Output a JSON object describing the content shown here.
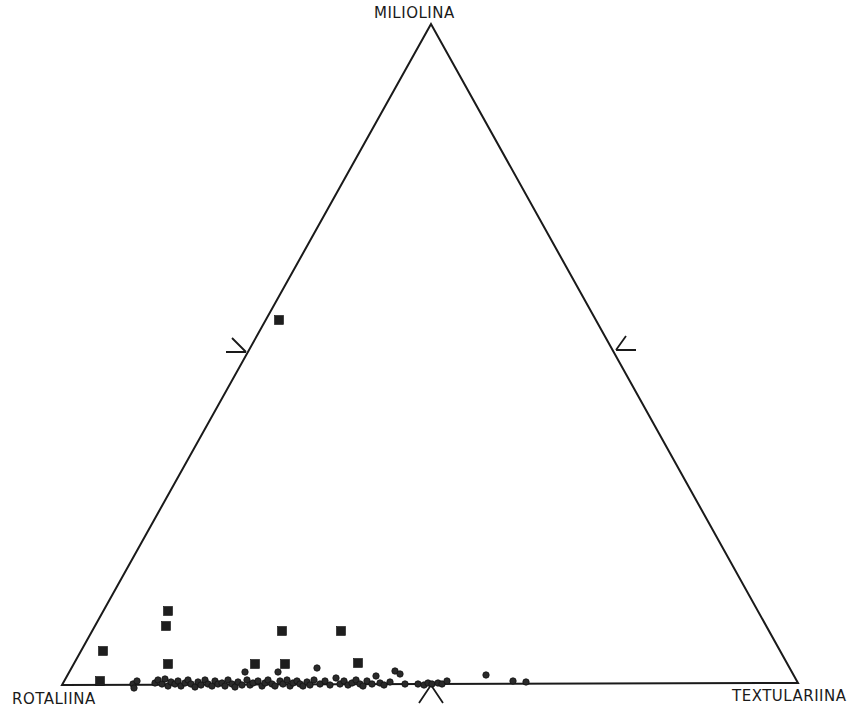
{
  "chart_data": {
    "type": "scatter",
    "subtype": "ternary",
    "title": "",
    "vertices": {
      "top": "MILIOLINA",
      "bottom_left": "ROTALIINA",
      "bottom_right": "TEXTULARIINA"
    },
    "components": [
      "Rotaliina",
      "Miliolina",
      "Textulariina"
    ],
    "units": "percent",
    "axis_marks": [
      {
        "edge": "left (Rotaliina–Miliolina)",
        "position_pct_miliolina": 50,
        "glyph": "arrow pointing toward edge"
      },
      {
        "edge": "right (Miliolina–Textulariina)",
        "position_pct_miliolina": 50,
        "glyph": "arrow pointing toward edge"
      },
      {
        "edge": "bottom (Rotaliina–Textulariina)",
        "position_pct_textulariina": 50,
        "glyph": "arrow pointing toward edge"
      }
    ],
    "grid": false,
    "legend": null,
    "series": [
      {
        "name": "squares",
        "marker": "filled-square",
        "points": [
          {
            "rotaliina": 46,
            "miliolina": 55,
            "textulariina": 0
          },
          {
            "rotaliina": 85,
            "miliolina": 11,
            "textulariina": 4
          },
          {
            "rotaliina": 84,
            "miliolina": 9,
            "textulariina": 7
          },
          {
            "rotaliina": 85,
            "miliolina": 3,
            "textulariina": 12
          },
          {
            "rotaliina": 92,
            "miliolina": 5,
            "textulariina": 3
          },
          {
            "rotaliina": 95,
            "miliolina": 0,
            "textulariina": 5
          },
          {
            "rotaliina": 68,
            "miliolina": 8,
            "textulariina": 24
          },
          {
            "rotaliina": 70,
            "miliolina": 3,
            "textulariina": 27
          },
          {
            "rotaliina": 67,
            "miliolina": 3,
            "textulariina": 30
          },
          {
            "rotaliina": 59,
            "miliolina": 8,
            "textulariina": 33
          },
          {
            "rotaliina": 57,
            "miliolina": 3,
            "textulariina": 40
          }
        ]
      },
      {
        "name": "circles",
        "marker": "filled-circle",
        "points_x_pct_textulariina_near_base": [
          10,
          11,
          13,
          14,
          15,
          16,
          17,
          18,
          19,
          20,
          21,
          22,
          23,
          24,
          25,
          26,
          27,
          28,
          29,
          30,
          31,
          32,
          33,
          34,
          35,
          36,
          37,
          38,
          39,
          40,
          41,
          42,
          43,
          44,
          45,
          46,
          47,
          48,
          49,
          50,
          51,
          52,
          58,
          61,
          62
        ],
        "points_above_base": [
          {
            "rotaliina": 74,
            "miliolina": 2,
            "textulariina": 24
          },
          {
            "rotaliina": 68,
            "miliolina": 2,
            "textulariina": 30
          },
          {
            "rotaliina": 62,
            "miliolina": 2,
            "textulariina": 36
          },
          {
            "rotaliina": 55,
            "miliolina": 2,
            "textulariina": 43
          },
          {
            "rotaliina": 40,
            "miliolina": 1,
            "textulariina": 59
          }
        ]
      }
    ]
  },
  "plot": {
    "width": 868,
    "height": 717,
    "triangle": {
      "top": [
        431,
        24
      ],
      "bottom_left": [
        62,
        685
      ],
      "bottom_right": [
        798,
        683
      ]
    },
    "line_color": "#1a1a1a",
    "marker_color": "#1a1a1a",
    "squares_px": [
      [
        279,
        320
      ],
      [
        168,
        611
      ],
      [
        166,
        626
      ],
      [
        282,
        631
      ],
      [
        341,
        631
      ],
      [
        103,
        651
      ],
      [
        168,
        664
      ],
      [
        255,
        664
      ],
      [
        285,
        664
      ],
      [
        358,
        663
      ],
      [
        100,
        681
      ]
    ],
    "circles_px": [
      [
        133,
        684
      ],
      [
        134,
        688
      ],
      [
        137,
        681
      ],
      [
        155,
        683
      ],
      [
        158,
        680
      ],
      [
        162,
        684
      ],
      [
        165,
        679
      ],
      [
        168,
        686
      ],
      [
        171,
        682
      ],
      [
        175,
        684
      ],
      [
        178,
        681
      ],
      [
        181,
        686
      ],
      [
        185,
        683
      ],
      [
        188,
        680
      ],
      [
        191,
        684
      ],
      [
        195,
        687
      ],
      [
        198,
        682
      ],
      [
        201,
        685
      ],
      [
        205,
        680
      ],
      [
        208,
        684
      ],
      [
        212,
        686
      ],
      [
        215,
        681
      ],
      [
        218,
        684
      ],
      [
        222,
        683
      ],
      [
        225,
        686
      ],
      [
        228,
        680
      ],
      [
        232,
        684
      ],
      [
        235,
        687
      ],
      [
        238,
        682
      ],
      [
        242,
        685
      ],
      [
        245,
        672
      ],
      [
        247,
        680
      ],
      [
        250,
        685
      ],
      [
        253,
        683
      ],
      [
        258,
        681
      ],
      [
        262,
        686
      ],
      [
        265,
        683
      ],
      [
        268,
        680
      ],
      [
        272,
        684
      ],
      [
        275,
        686
      ],
      [
        278,
        672
      ],
      [
        280,
        681
      ],
      [
        283,
        684
      ],
      [
        287,
        680
      ],
      [
        290,
        686
      ],
      [
        293,
        683
      ],
      [
        297,
        681
      ],
      [
        300,
        684
      ],
      [
        303,
        686
      ],
      [
        307,
        682
      ],
      [
        310,
        685
      ],
      [
        314,
        680
      ],
      [
        317,
        668
      ],
      [
        320,
        684
      ],
      [
        325,
        681
      ],
      [
        330,
        685
      ],
      [
        336,
        678
      ],
      [
        340,
        684
      ],
      [
        344,
        681
      ],
      [
        348,
        685
      ],
      [
        352,
        683
      ],
      [
        356,
        680
      ],
      [
        360,
        684
      ],
      [
        363,
        686
      ],
      [
        367,
        681
      ],
      [
        372,
        684
      ],
      [
        376,
        676
      ],
      [
        380,
        683
      ],
      [
        384,
        685
      ],
      [
        390,
        682
      ],
      [
        395,
        671
      ],
      [
        400,
        674
      ],
      [
        405,
        684
      ],
      [
        418,
        684
      ],
      [
        424,
        685
      ],
      [
        428,
        683
      ],
      [
        432,
        684
      ],
      [
        438,
        683
      ],
      [
        442,
        684
      ],
      [
        447,
        681
      ],
      [
        486,
        675
      ],
      [
        513,
        681
      ],
      [
        526,
        682
      ]
    ],
    "marks": {
      "left": {
        "cx": 246,
        "cy": 352
      },
      "right": {
        "cx": 616,
        "cy": 352
      },
      "bottom": {
        "cx": 431,
        "cy": 685
      }
    }
  },
  "labels": {
    "top": "MILIOLINA",
    "left": "ROTALIINA",
    "right": "TEXTULARIINA"
  }
}
